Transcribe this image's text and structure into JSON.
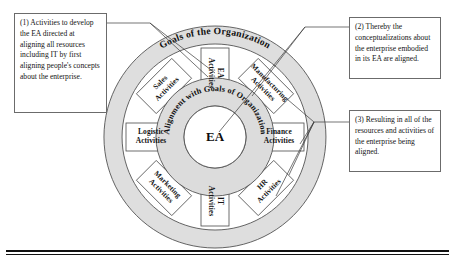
{
  "figure": {
    "title_ring_outer": "Goals of the Organization",
    "title_ring_inner": "Alignment with Goals of Organization",
    "hub_label": "EA"
  },
  "wheel": {
    "spokes": [
      {
        "id": "ea",
        "label_line1": "EA",
        "label_line2": "Activities",
        "angle_deg": -90
      },
      {
        "id": "manufacturing",
        "label_line1": "Manufacturing",
        "label_line2": "Activities",
        "angle_deg": -45
      },
      {
        "id": "finance",
        "label_line1": "Finance",
        "label_line2": "Activities",
        "angle_deg": 0
      },
      {
        "id": "hr",
        "label_line1": "HR",
        "label_line2": "Activities",
        "angle_deg": 45
      },
      {
        "id": "it",
        "label_line1": "IT",
        "label_line2": "Activities",
        "angle_deg": 90
      },
      {
        "id": "marketing",
        "label_line1": "Marketing",
        "label_line2": "Activities",
        "angle_deg": 135
      },
      {
        "id": "logistic",
        "label_line1": "Logistic",
        "label_line2": "Activities",
        "angle_deg": 180
      },
      {
        "id": "sales",
        "label_line1": "Sales",
        "label_line2": "Activities",
        "angle_deg": -135
      }
    ]
  },
  "callouts": [
    {
      "id": "callout-1",
      "text": "(1) Activities to develop the EA directed at aligning all resources including IT by first aligning people's concepts about the enterprise."
    },
    {
      "id": "callout-2",
      "text": "(2) Thereby the conceptualizations about the enterprise embodied in its EA are aligned."
    },
    {
      "id": "callout-3",
      "text": "(3) Resulting in all of the resources and activities of the enterprise being aligned."
    }
  ],
  "colors": {
    "rim_fill": "#dedede",
    "hub_fill": "#dcdcdc",
    "stroke": "#4a4a4a",
    "box_border": "#6b6b6b",
    "rule": "#111111"
  }
}
